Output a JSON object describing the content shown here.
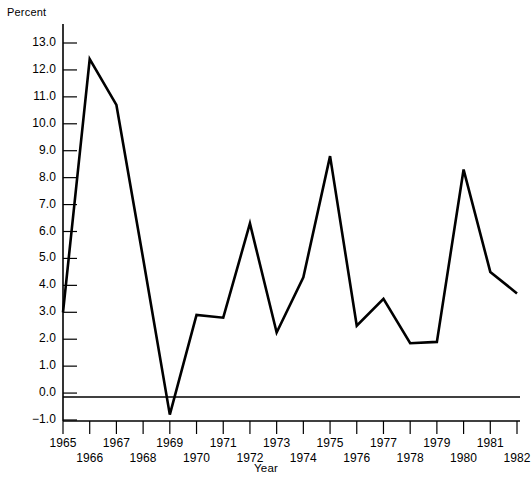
{
  "chart_data": {
    "type": "line",
    "title": "",
    "xlabel": "Year",
    "ylabel": "Percent",
    "ylim": [
      -1.0,
      13.0
    ],
    "xlim": [
      1965,
      1982
    ],
    "grid": false,
    "legend": null,
    "y_ticks": [
      "13.0",
      "12.0",
      "11.0",
      "10.0",
      "9.0",
      "8.0",
      "7.0",
      "6.0",
      "5.0",
      "4.0",
      "3.0",
      "2.0",
      "1.0",
      "0.0",
      "−1.0"
    ],
    "y_tick_values": [
      13.0,
      12.0,
      11.0,
      10.0,
      9.0,
      8.0,
      7.0,
      6.0,
      5.0,
      4.0,
      3.0,
      2.0,
      1.0,
      0.0,
      -1.0
    ],
    "x_ticks": [
      "1965",
      "1966",
      "1967",
      "1968",
      "1969",
      "1970",
      "1971",
      "1972",
      "1973",
      "1974",
      "1975",
      "1976",
      "1977",
      "1978",
      "1979",
      "1980",
      "1981",
      "1982"
    ],
    "x": [
      1965,
      1966,
      1967,
      1968,
      1969,
      1970,
      1971,
      1972,
      1973,
      1974,
      1975,
      1976,
      1977,
      1978,
      1979,
      1980,
      1981,
      1982
    ],
    "values": [
      3.0,
      12.4,
      10.7,
      5.0,
      -0.8,
      2.9,
      2.8,
      6.3,
      2.25,
      4.3,
      8.8,
      2.5,
      3.5,
      1.85,
      1.9,
      8.3,
      4.5,
      3.7
    ],
    "categories": [
      "1965",
      "1966",
      "1967",
      "1968",
      "1969",
      "1970",
      "1971",
      "1972",
      "1973",
      "1974",
      "1975",
      "1976",
      "1977",
      "1978",
      "1979",
      "1980",
      "1981",
      "1982"
    ],
    "zero_line": 0.0,
    "line_color": "#000000",
    "axis_color": "#000000",
    "background_color": "#ffffff"
  }
}
